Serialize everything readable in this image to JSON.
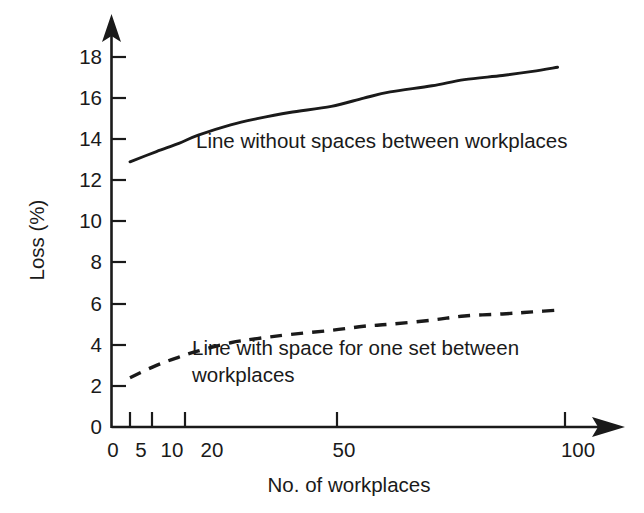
{
  "chart_data": {
    "type": "line",
    "title": "",
    "subtitle": "",
    "xlabel": "No. of workplaces",
    "ylabel": "Loss (%)",
    "xscale": "log",
    "yscale": "linear",
    "xlim": [
      4,
      108
    ],
    "ylim": [
      0,
      19
    ],
    "grid": false,
    "legend_position": "inline-annotations",
    "x_ticks": [
      {
        "value": 0,
        "label": "0"
      },
      {
        "value": 5,
        "label": "5"
      },
      {
        "value": 10,
        "label": "10"
      },
      {
        "value": 20,
        "label": "20"
      },
      {
        "value": 50,
        "label": "50"
      },
      {
        "value": 100,
        "label": "100"
      }
    ],
    "y_ticks": [
      {
        "value": 0,
        "label": "0"
      },
      {
        "value": 2,
        "label": "2"
      },
      {
        "value": 4,
        "label": "4"
      },
      {
        "value": 6,
        "label": "6"
      },
      {
        "value": 8,
        "label": "8"
      },
      {
        "value": 10,
        "label": "10"
      },
      {
        "value": 12,
        "label": "12"
      },
      {
        "value": 14,
        "label": "14"
      },
      {
        "value": 16,
        "label": "16"
      },
      {
        "value": 18,
        "label": "18"
      }
    ],
    "series": [
      {
        "name": "Line without spaces between workplaces",
        "style": "solid",
        "color": "#1a1a1a",
        "x": [
          5,
          6,
          7,
          8,
          10,
          12,
          15,
          20,
          25,
          30,
          40,
          50,
          65,
          80,
          95
        ],
        "values": [
          12.9,
          13.4,
          13.8,
          14.2,
          14.7,
          15.0,
          15.3,
          15.6,
          16.0,
          16.3,
          16.6,
          16.9,
          17.1,
          17.3,
          17.5
        ]
      },
      {
        "name": "Line with space for one set between workplaces",
        "style": "dashed",
        "color": "#1a1a1a",
        "x": [
          5,
          6,
          7,
          8,
          10,
          12,
          15,
          20,
          25,
          30,
          40,
          50,
          65,
          80,
          98
        ],
        "values": [
          2.4,
          3.0,
          3.4,
          3.7,
          4.1,
          4.3,
          4.5,
          4.7,
          4.9,
          5.0,
          5.2,
          5.4,
          5.5,
          5.6,
          5.7
        ]
      }
    ],
    "annotations": [
      {
        "id": "annotation-upper",
        "lines": [
          "Line without spaces between workplaces"
        ],
        "x_px": 196,
        "y_px": 148
      },
      {
        "id": "annotation-lower",
        "lines": [
          "Line with space for one set between",
          "workplaces"
        ],
        "x_px": 192,
        "y_px": 355
      }
    ],
    "axis_arrows": {
      "x_axis": "arrow-right",
      "y_axis": "arrow-up"
    }
  }
}
